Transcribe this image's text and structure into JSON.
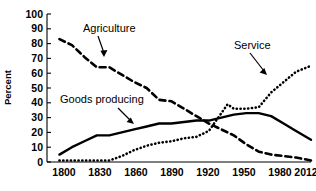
{
  "chart_data": {
    "type": "line",
    "title": "",
    "subtitle": "",
    "xlabel": "",
    "ylabel": "Percent",
    "xlim": [
      1800,
      2012
    ],
    "ylim": [
      0,
      100
    ],
    "grid": false,
    "legend_position": "inline-annotations",
    "x_ticks": [
      "1800",
      "1830",
      "1860",
      "1890",
      "1920",
      "1950",
      "1980",
      "2012"
    ],
    "x_tick_values": [
      1800,
      1830,
      1860,
      1890,
      1920,
      1950,
      1980,
      2012
    ],
    "y_ticks": [
      "0",
      "10",
      "20",
      "30",
      "40",
      "50",
      "60",
      "70",
      "80",
      "90",
      "100"
    ],
    "y_tick_values": [
      0,
      10,
      20,
      30,
      40,
      50,
      60,
      70,
      80,
      90,
      100
    ],
    "series": [
      {
        "name": "Agriculture",
        "style": "dashed",
        "color": "#000000",
        "x": [
          1810,
          1820,
          1830,
          1840,
          1850,
          1860,
          1870,
          1880,
          1890,
          1900,
          1910,
          1920,
          1930,
          1940,
          1950,
          1960,
          1970,
          1980,
          1990,
          2000,
          2012
        ],
        "values": [
          83,
          79,
          71,
          64,
          64,
          59,
          54,
          50,
          42,
          41,
          36,
          31,
          26,
          22,
          18,
          12,
          7,
          5,
          4,
          3,
          1
        ]
      },
      {
        "name": "Goods producing",
        "style": "solid",
        "color": "#000000",
        "x": [
          1810,
          1820,
          1830,
          1840,
          1850,
          1860,
          1870,
          1880,
          1890,
          1900,
          1910,
          1920,
          1930,
          1940,
          1950,
          1960,
          1970,
          1980,
          1990,
          2000,
          2012
        ],
        "values": [
          5,
          10,
          14,
          18,
          18,
          20,
          22,
          24,
          26,
          26,
          27,
          28,
          28,
          30,
          32,
          33,
          33,
          31,
          26,
          21,
          15
        ]
      },
      {
        "name": "Service",
        "style": "dotted",
        "color": "#000000",
        "x": [
          1810,
          1820,
          1830,
          1840,
          1850,
          1860,
          1870,
          1880,
          1890,
          1900,
          1910,
          1920,
          1930,
          1945,
          1950,
          1960,
          1970,
          1980,
          1990,
          2000,
          2012
        ],
        "values": [
          1,
          1,
          1,
          1,
          1,
          4,
          8,
          11,
          13,
          14,
          16,
          17,
          21,
          39,
          36,
          36,
          37,
          47,
          54,
          61,
          65
        ]
      }
    ],
    "annotations": [
      {
        "text": "Agriculture",
        "target_series": "Agriculture"
      },
      {
        "text": "Goods producing",
        "target_series": "Goods producing"
      },
      {
        "text": "Service",
        "target_series": "Service"
      }
    ]
  }
}
